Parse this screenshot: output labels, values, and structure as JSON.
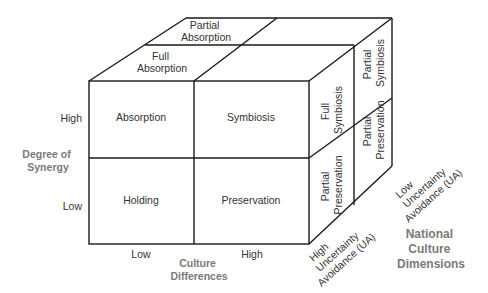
{
  "diagram": {
    "front_face": {
      "top_left": "Absorption",
      "top_right": "Symbiosis",
      "bottom_left": "Holding",
      "bottom_right": "Preservation"
    },
    "top_face": {
      "front": "Full Absorption",
      "front_lines": [
        "Full",
        "Absorption"
      ],
      "back": "Partial Absorption",
      "back_lines": [
        "Partial",
        "Absorption"
      ]
    },
    "right_face": {
      "front_top_lines": [
        "Full",
        "Symbiosis"
      ],
      "back_top_lines": [
        "Partial",
        "Symbiosis"
      ],
      "front_bottom_lines": [
        "Partial",
        "Preservation"
      ],
      "back_bottom_lines": [
        "Partial",
        "Preservation"
      ]
    },
    "y_axis": {
      "title_lines": [
        "Degree of",
        "Synergy"
      ],
      "high": "High",
      "low": "Low"
    },
    "x_axis": {
      "title_lines": [
        "Culture",
        "Differences"
      ],
      "low": "Low",
      "high": "High"
    },
    "z_axis": {
      "title_lines": [
        "National",
        "Culture",
        "Dimensions"
      ],
      "high_lines": [
        "High",
        "Uncertainty",
        "Avoidance (UA)"
      ],
      "low_lines": [
        "Low",
        "Uncertainty",
        "Avoidance (UA)"
      ]
    },
    "colors": {
      "line": "#1a1a1a",
      "text": "#333333",
      "axis_title": "#7a7a7a"
    }
  }
}
